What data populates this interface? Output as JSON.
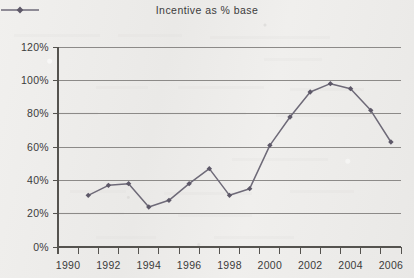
{
  "legend": {
    "series_label": "Incentive as % base",
    "marker_icon": "diamond-marker-icon",
    "position": "top-center"
  },
  "colors": {
    "line": "#6e6a78",
    "marker": "#5d5868",
    "gridline": "#8c8a88",
    "axis": "#55534f",
    "text": "#3b3b3b",
    "background": "#edecea"
  },
  "chart_data": {
    "type": "line",
    "title": "",
    "subtitle": "",
    "xlabel": "",
    "ylabel": "",
    "xlim": [
      1990,
      2007
    ],
    "ylim": [
      0,
      120
    ],
    "ytick_values": [
      0,
      20,
      40,
      60,
      80,
      100,
      120
    ],
    "ytick_labels": [
      "0%",
      "20%",
      "40%",
      "60%",
      "80%",
      "100%",
      "120%"
    ],
    "xtick_labels": [
      "1990",
      "1992",
      "1994",
      "1996",
      "1998",
      "2000",
      "2002",
      "2004",
      "2006"
    ],
    "xtick_values": [
      1990,
      1992,
      1994,
      1996,
      1998,
      2000,
      2002,
      2004,
      2006
    ],
    "minor_xticks_every": 1,
    "grid": "horizontal",
    "legend_position": "top-center",
    "series": [
      {
        "name": "Incentive as % base",
        "x": [
          1991.5,
          1992.5,
          1993.5,
          1994.5,
          1995.5,
          1996.5,
          1997.5,
          1998.5,
          1999.5,
          2000.5,
          2001.5,
          2002.5,
          2003.5,
          2004.5,
          2005.5,
          2006.5
        ],
        "values": [
          31,
          37,
          38,
          24,
          28,
          38,
          47,
          31,
          35,
          61,
          78,
          93,
          98,
          95,
          82,
          63
        ],
        "marker": "diamond",
        "units": "percent"
      }
    ]
  }
}
